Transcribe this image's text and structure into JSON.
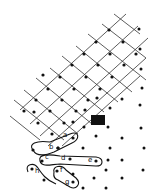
{
  "figure": {
    "colors": {
      "ink": "#111111",
      "grid": "#333333",
      "background": "#ffffff"
    },
    "labels": [
      "a",
      "b",
      "c",
      "d",
      "e",
      "f",
      "g",
      "h"
    ]
  },
  "lattice": {
    "dots": [
      [
        109,
        30
      ],
      [
        96,
        42
      ],
      [
        84,
        54
      ],
      [
        72,
        65
      ],
      [
        60,
        77
      ],
      [
        48,
        89
      ],
      [
        36,
        100
      ],
      [
        24,
        111
      ],
      [
        123,
        42
      ],
      [
        110,
        54
      ],
      [
        98,
        65
      ],
      [
        86,
        77
      ],
      [
        74,
        89
      ],
      [
        62,
        100
      ],
      [
        50,
        111
      ],
      [
        38,
        123
      ],
      [
        136,
        54
      ],
      [
        124,
        65
      ],
      [
        112,
        77
      ],
      [
        100,
        89
      ],
      [
        88,
        100
      ],
      [
        76,
        111
      ],
      [
        64,
        123
      ],
      [
        52,
        134
      ],
      [
        97,
        98
      ],
      [
        85,
        110
      ],
      [
        73,
        122
      ],
      [
        58,
        148
      ],
      [
        33,
        150
      ],
      [
        34,
        112
      ],
      [
        43,
        75
      ]
    ]
  },
  "scatter": {
    "dots": [
      [
        139,
        29
      ],
      [
        140,
        49
      ],
      [
        141,
        69
      ],
      [
        142,
        88
      ],
      [
        122,
        99
      ],
      [
        110,
        108
      ],
      [
        140,
        105
      ],
      [
        84,
        127
      ],
      [
        108,
        127
      ],
      [
        141,
        128
      ],
      [
        96,
        136
      ],
      [
        122,
        138
      ],
      [
        83,
        148
      ],
      [
        110,
        148
      ],
      [
        144,
        148
      ],
      [
        108,
        160
      ],
      [
        122,
        160
      ],
      [
        106,
        170
      ],
      [
        143,
        170
      ],
      [
        73,
        174
      ],
      [
        94,
        178
      ],
      [
        122,
        178
      ],
      [
        83,
        188
      ],
      [
        106,
        188
      ],
      [
        44,
        180
      ]
    ]
  },
  "block": {
    "x": 91,
    "y": 115,
    "width": 14,
    "height": 10
  },
  "groups": [
    {
      "label": "a",
      "label_pos": [
        63,
        137
      ],
      "dot": [
        73,
        138
      ]
    },
    {
      "label": "b",
      "label_pos": [
        49,
        149
      ],
      "dot": [
        58,
        148
      ]
    },
    {
      "label": "c",
      "label_pos": [
        45,
        159
      ],
      "dot": [
        42,
        161
      ]
    },
    {
      "label": "d",
      "label_pos": [
        61,
        160
      ],
      "dot": [
        70,
        159
      ]
    },
    {
      "label": "e",
      "label_pos": [
        88,
        162
      ],
      "dot": [
        96,
        161
      ]
    },
    {
      "label": "f",
      "label_pos": [
        60,
        172
      ],
      "dot": [
        57,
        171
      ]
    },
    {
      "label": "g",
      "label_pos": [
        65,
        184
      ],
      "dot": [
        73,
        182
      ]
    },
    {
      "label": "h",
      "label_pos": [
        35,
        173
      ],
      "dot": [
        32,
        169
      ]
    }
  ]
}
